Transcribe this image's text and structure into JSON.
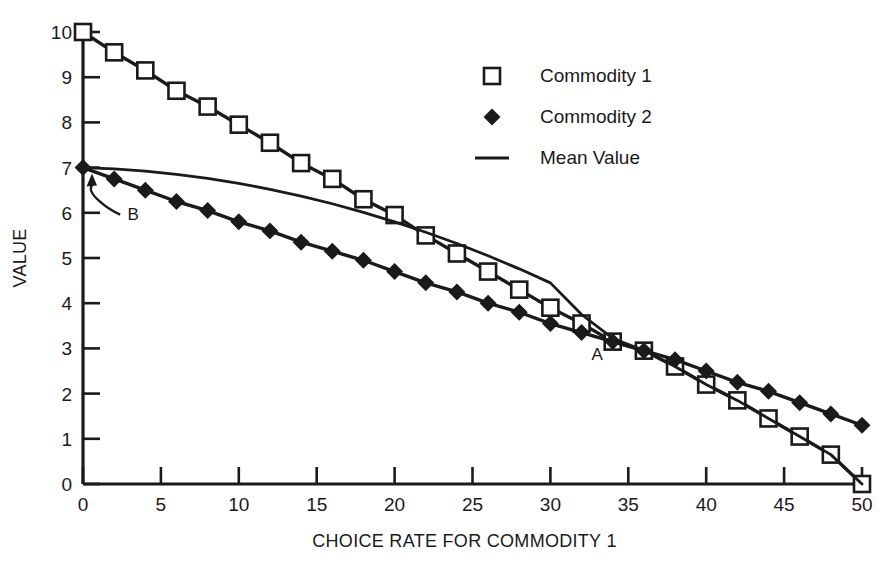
{
  "chart_data": {
    "type": "line",
    "title": "",
    "xlabel": "CHOICE RATE FOR COMMODITY 1",
    "ylabel": "VALUE",
    "xlim": [
      0,
      50
    ],
    "ylim": [
      0,
      10
    ],
    "xticks": [
      0,
      5,
      10,
      15,
      20,
      25,
      30,
      35,
      40,
      45,
      50
    ],
    "yticks": [
      0,
      1,
      2,
      3,
      4,
      5,
      6,
      7,
      8,
      9,
      10
    ],
    "grid": false,
    "legend_position": "upper right",
    "x": [
      0,
      2,
      4,
      6,
      8,
      10,
      12,
      14,
      16,
      18,
      20,
      22,
      24,
      26,
      28,
      30,
      32,
      34,
      36,
      38,
      40,
      42,
      44,
      46,
      48,
      50
    ],
    "series": [
      {
        "name": "Commodity 1",
        "marker": "open-square",
        "values": [
          10.0,
          9.55,
          9.15,
          8.7,
          8.35,
          7.95,
          7.55,
          7.1,
          6.75,
          6.3,
          5.95,
          5.5,
          5.1,
          4.7,
          4.3,
          3.9,
          3.55,
          3.15,
          2.95,
          2.6,
          2.2,
          1.85,
          1.45,
          1.05,
          0.65,
          0.0
        ]
      },
      {
        "name": "Commodity 2",
        "marker": "filled-diamond",
        "values": [
          7.0,
          6.75,
          6.5,
          6.25,
          6.05,
          5.8,
          5.6,
          5.35,
          5.15,
          4.95,
          4.7,
          4.45,
          4.25,
          4.0,
          3.8,
          3.55,
          3.35,
          3.15,
          2.95,
          2.75,
          2.5,
          2.25,
          2.05,
          1.8,
          1.55,
          1.3
        ]
      },
      {
        "name": "Mean Value",
        "marker": "none",
        "values": [
          7.0,
          6.97,
          6.92,
          6.85,
          6.76,
          6.65,
          6.52,
          6.37,
          6.2,
          6.01,
          5.8,
          5.57,
          5.32,
          5.05,
          4.76,
          4.45,
          3.75,
          3.22,
          2.96,
          2.6,
          2.2,
          1.85,
          1.45,
          1.05,
          0.65,
          0.0
        ]
      }
    ],
    "annotations": [
      {
        "label": "A",
        "x": 33,
        "y": 2.75,
        "kind": "point-label"
      },
      {
        "label": "B",
        "x": 2,
        "y": 6.05,
        "kind": "arrow-label",
        "points_to": {
          "x": 0,
          "y": 7.0
        }
      }
    ]
  },
  "legend": {
    "items": [
      {
        "label": "Commodity 1",
        "symbol": "open-square"
      },
      {
        "label": "Commodity 2",
        "symbol": "filled-diamond"
      },
      {
        "label": "Mean Value",
        "symbol": "line"
      }
    ]
  },
  "axes": {
    "x_title": "CHOICE RATE FOR COMMODITY 1",
    "y_title": "VALUE",
    "x_tick_labels": [
      "0",
      "5",
      "10",
      "15",
      "20",
      "25",
      "30",
      "35",
      "40",
      "45",
      "50"
    ],
    "y_tick_labels": [
      "0",
      "1",
      "2",
      "3",
      "4",
      "5",
      "6",
      "7",
      "8",
      "9",
      "10"
    ]
  },
  "annotations": {
    "a_label": "A",
    "b_label": "B"
  },
  "colors": {
    "ink": "#1a1a1a",
    "background": "#ffffff",
    "marker_fill_open": "#ffffff"
  }
}
